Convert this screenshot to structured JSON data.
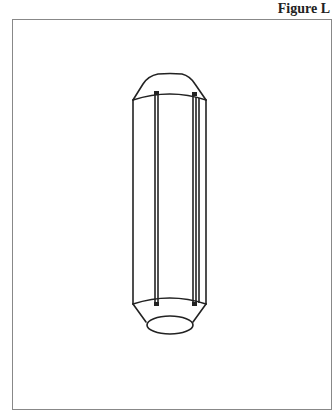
{
  "figure": {
    "label": "Figure L"
  },
  "colors": {
    "line": "#222222",
    "frame": "#888888",
    "background": "#ffffff"
  }
}
